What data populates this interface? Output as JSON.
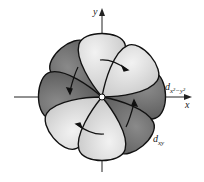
{
  "diagram": {
    "axes": {
      "x_label": "x",
      "y_label": "y"
    },
    "orbitals": [
      {
        "label_main": "d",
        "label_sub": "x²−y²",
        "shade": "dark",
        "lobes": [
          "upper-left",
          "left",
          "right",
          "lower-right"
        ]
      },
      {
        "label_main": "d",
        "label_sub": "xy",
        "shade": "light",
        "lobes": [
          "top",
          "upper-right",
          "lower-left",
          "bottom"
        ]
      }
    ],
    "colors": {
      "dark_lobe": "#6b6b6b",
      "light_lobe": "#cfcfcf",
      "outline": "#111111",
      "axis": "#222222"
    },
    "rotation_arrows": 4
  }
}
